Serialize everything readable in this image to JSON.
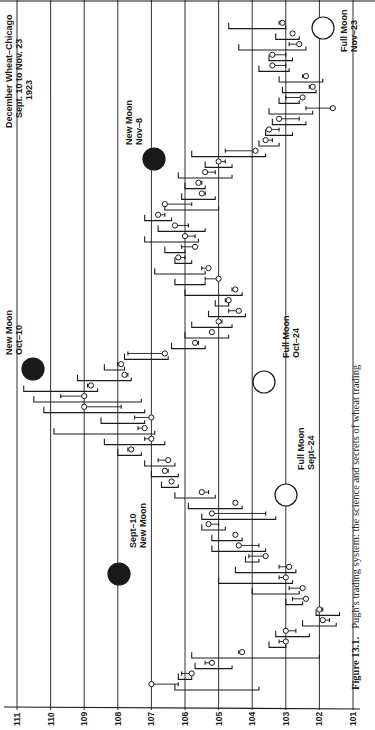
{
  "chart_data": {
    "type": "bar",
    "subtype": "OHLC price bars (page rotated 90° counter-clockwise)",
    "title": "December Wheat–Chicago",
    "subtitle_line1": "Sept. 10 to Nov. 23",
    "subtitle_line2": "1923",
    "xlabel": "Trading days (Sept. 10 → Nov. 23)",
    "ylabel": "Price",
    "ylim": [
      101,
      111
    ],
    "price_ticks": [
      "111",
      "110",
      "109",
      "108",
      "107",
      "106",
      "105",
      "104",
      "103",
      "102",
      "101"
    ],
    "grid": true,
    "annotations": [
      {
        "id": "sept10",
        "phase": "new",
        "line1": "Sept–10",
        "line2": "New Moon",
        "day": 0
      },
      {
        "id": "sept24",
        "phase": "full",
        "line1": "Full Moon",
        "line2": "Sept–24",
        "day": 10
      },
      {
        "id": "oct10",
        "phase": "new",
        "line1": "New Moon",
        "line2": "Oct–10",
        "day": 24
      },
      {
        "id": "oct24",
        "phase": "full",
        "line1": "Full Moon",
        "line2": "Oct–24",
        "day": 36
      },
      {
        "id": "nov8",
        "phase": "new",
        "line1": "New Moon",
        "line2": "Nov–8",
        "day": 49
      },
      {
        "id": "nov23",
        "phase": "full",
        "line1": "Full Moon",
        "line2": "Nov–23",
        "day": 62
      }
    ],
    "bars": [
      {
        "high": 106.3,
        "low": 103.8,
        "open": 106.2,
        "close": 107.0
      },
      {
        "high": 106.2,
        "low": 105.8,
        "open": 106.1,
        "close": 105.8
      },
      {
        "high": 105.7,
        "low": 104.6,
        "open": 105.4,
        "close": 105.2
      },
      {
        "high": 105.8,
        "low": 102.0,
        "open": 104.4,
        "close": 104.3
      },
      {
        "high": 103.5,
        "low": 103.0,
        "open": 103.2,
        "close": 103.0
      },
      {
        "high": 103.3,
        "low": 102.3,
        "open": 102.7,
        "close": 103.0
      },
      {
        "high": 102.5,
        "low": 101.5,
        "open": 101.7,
        "close": 101.9
      },
      {
        "high": 102.1,
        "low": 101.4,
        "open": 101.9,
        "close": 102.0
      },
      {
        "high": 103.0,
        "low": 102.5,
        "open": 102.8,
        "close": 102.4
      },
      {
        "high": 104.0,
        "low": 102.6,
        "open": 102.9,
        "close": 102.5
      },
      {
        "high": 105.0,
        "low": 102.8,
        "open": 103.2,
        "close": 103.0
      },
      {
        "high": 104.5,
        "low": 102.7,
        "open": 103.2,
        "close": 102.9
      },
      {
        "high": 104.2,
        "low": 103.8,
        "open": 104.1,
        "close": 103.6
      },
      {
        "high": 105.2,
        "low": 103.6,
        "open": 103.8,
        "close": 104.4
      },
      {
        "high": 105.2,
        "low": 104.3,
        "open": 104.5,
        "close": 104.5
      },
      {
        "high": 105.5,
        "low": 104.8,
        "open": 105.0,
        "close": 105.3
      },
      {
        "high": 105.5,
        "low": 103.3,
        "open": 103.6,
        "close": 105.2
      },
      {
        "high": 105.9,
        "low": 104.3,
        "open": 104.5,
        "close": 104.5
      },
      {
        "high": 106.3,
        "low": 105.1,
        "open": 105.3,
        "close": 105.5
      },
      {
        "high": 106.7,
        "low": 106.2,
        "open": 106.4,
        "close": 106.4
      },
      {
        "high": 107.0,
        "low": 106.2,
        "open": 106.5,
        "close": 106.6
      },
      {
        "high": 107.2,
        "low": 106.3,
        "open": 106.8,
        "close": 106.5
      },
      {
        "high": 108.0,
        "low": 107.3,
        "open": 107.7,
        "close": 107.6
      },
      {
        "high": 108.4,
        "low": 106.6,
        "open": 107.2,
        "close": 107.0
      },
      {
        "high": 109.9,
        "low": 106.9,
        "open": 107.4,
        "close": 107.2
      },
      {
        "high": 108.5,
        "low": 107.2,
        "open": 107.5,
        "close": 107.0
      },
      {
        "high": 110.2,
        "low": 107.2,
        "open": 107.9,
        "close": 109.0
      },
      {
        "high": 110.5,
        "low": 107.3,
        "open": 109.7,
        "close": 109.0
      },
      {
        "high": 110.8,
        "low": 108.6,
        "open": 108.9,
        "close": 108.8
      },
      {
        "high": 109.2,
        "low": 107.6,
        "open": 107.7,
        "close": 107.8
      },
      {
        "high": 108.4,
        "low": 107.8,
        "open": 108.0,
        "close": 107.9
      },
      {
        "high": 107.8,
        "low": 106.5,
        "open": 107.7,
        "close": 106.6
      },
      {
        "high": 106.4,
        "low": 105.4,
        "open": 105.6,
        "close": 105.7
      },
      {
        "high": 106.0,
        "low": 104.7,
        "open": 105.2,
        "close": 105.2
      },
      {
        "high": 105.8,
        "low": 104.6,
        "open": 104.9,
        "close": 105.0
      },
      {
        "high": 105.3,
        "low": 104.2,
        "open": 104.7,
        "close": 104.4
      },
      {
        "high": 105.1,
        "low": 104.7,
        "open": 104.8,
        "close": 104.7
      },
      {
        "high": 106.0,
        "low": 104.3,
        "open": 104.6,
        "close": 104.5
      },
      {
        "high": 106.3,
        "low": 105.4,
        "open": 105.4,
        "close": 105.0
      },
      {
        "high": 106.9,
        "low": 105.4,
        "open": 105.5,
        "close": 105.3
      },
      {
        "high": 106.3,
        "low": 105.8,
        "open": 106.0,
        "close": 106.2
      },
      {
        "high": 106.6,
        "low": 106.0,
        "open": 106.1,
        "close": 105.7
      },
      {
        "high": 107.2,
        "low": 105.6,
        "open": 105.7,
        "close": 106.0
      },
      {
        "high": 106.8,
        "low": 105.4,
        "open": 105.9,
        "close": 106.3
      },
      {
        "high": 107.2,
        "low": 106.4,
        "open": 106.6,
        "close": 106.8
      },
      {
        "high": 106.6,
        "low": 105.0,
        "open": 105.8,
        "close": 106.6
      },
      {
        "high": 106.1,
        "low": 105.1,
        "open": 105.4,
        "close": 105.5
      },
      {
        "high": 106.0,
        "low": 105.4,
        "open": 105.5,
        "close": 105.6
      },
      {
        "high": 106.2,
        "low": 104.6,
        "open": 105.1,
        "close": 105.4
      },
      {
        "high": 105.4,
        "low": 104.6,
        "open": 104.8,
        "close": 105.0
      },
      {
        "high": 105.8,
        "low": 103.6,
        "open": 104.8,
        "close": 103.9
      },
      {
        "high": 103.8,
        "low": 103.2,
        "open": 103.4,
        "close": 103.6
      },
      {
        "high": 103.6,
        "low": 102.8,
        "open": 103.2,
        "close": 103.5
      },
      {
        "high": 103.4,
        "low": 102.4,
        "open": 102.6,
        "close": 103.2
      },
      {
        "high": 103.5,
        "low": 102.2,
        "open": 102.4,
        "close": 101.6
      },
      {
        "high": 103.2,
        "low": 102.6,
        "open": 103.0,
        "close": 102.5
      },
      {
        "high": 103.1,
        "low": 102.1,
        "open": 102.3,
        "close": 102.2
      },
      {
        "high": 103.2,
        "low": 101.9,
        "open": 102.5,
        "close": 102.4
      },
      {
        "high": 103.8,
        "low": 102.9,
        "open": 103.0,
        "close": 103.4
      },
      {
        "high": 103.5,
        "low": 102.8,
        "open": 103.0,
        "close": 103.4
      },
      {
        "high": 104.4,
        "low": 102.4,
        "open": 102.9,
        "close": 102.6
      },
      {
        "high": 103.3,
        "low": 102.6,
        "open": 102.8,
        "close": 102.8
      },
      {
        "high": 104.7,
        "low": 103.0,
        "open": 103.2,
        "close": 103.1
      }
    ],
    "caption_label": "Figure 13.1.",
    "caption_text": "Pugh's trading system: the science and secrets of wheat trading"
  },
  "colors": {
    "ink": "#1a1a1a",
    "paper": "#ffffff"
  }
}
